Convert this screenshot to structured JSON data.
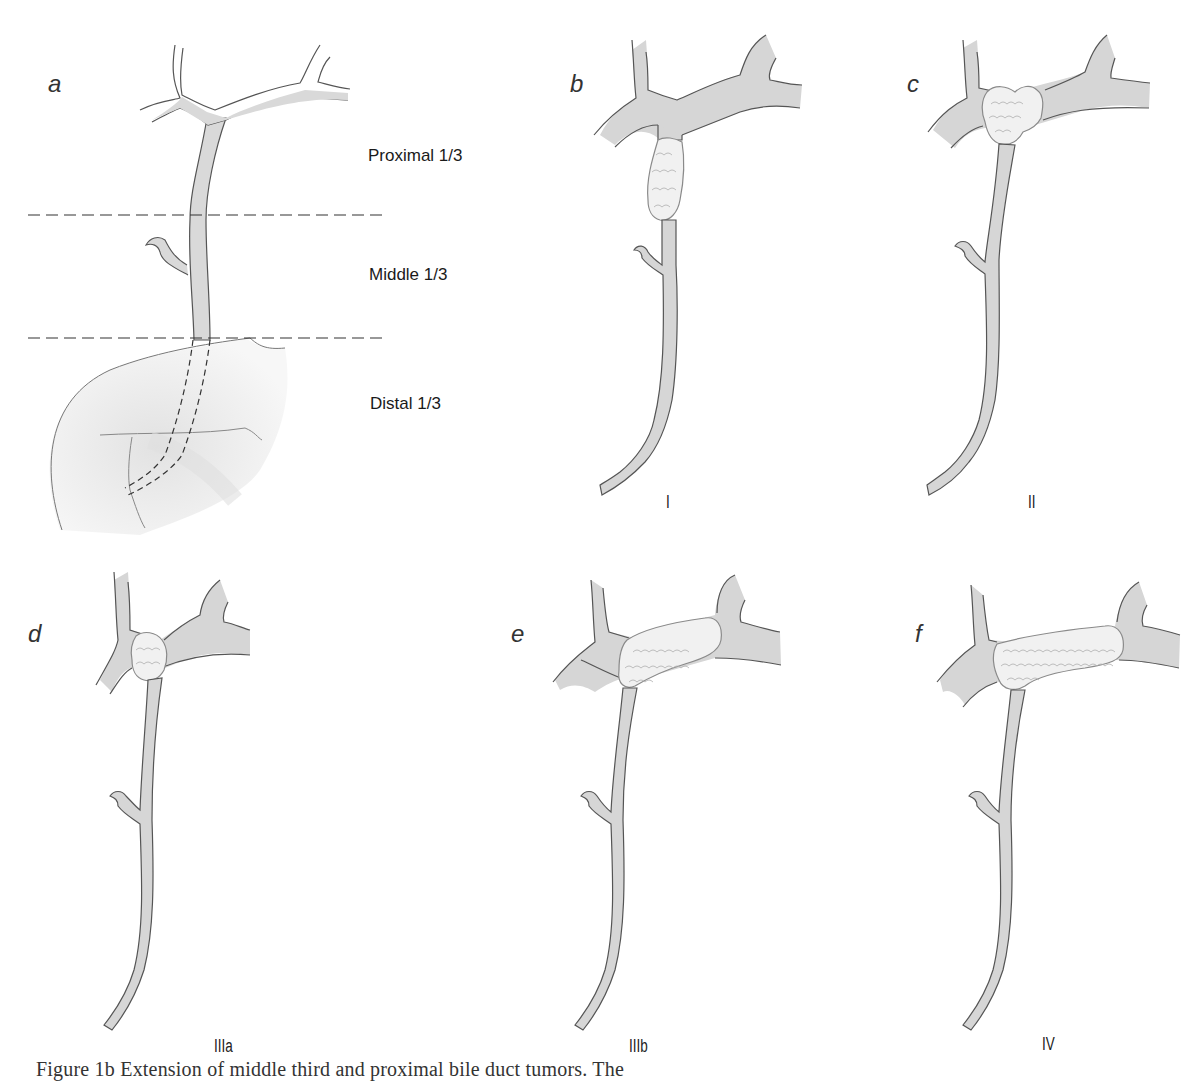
{
  "figure": {
    "panels": [
      {
        "id": "a",
        "letter": "a",
        "type_label": "",
        "description": "Bile duct divided into thirds",
        "regions": [
          "Proximal 1/3",
          "Middle 1/3",
          "Distal 1/3"
        ]
      },
      {
        "id": "b",
        "letter": "b",
        "type_label": "I",
        "description": "Tumor below hilar confluence"
      },
      {
        "id": "c",
        "letter": "c",
        "type_label": "II",
        "description": "Tumor at hilar confluence"
      },
      {
        "id": "d",
        "letter": "d",
        "type_label": "IIIa",
        "description": "Tumor extending into right hepatic duct"
      },
      {
        "id": "e",
        "letter": "e",
        "type_label": "IIIb",
        "description": "Tumor extending into left hepatic duct"
      },
      {
        "id": "f",
        "letter": "f",
        "type_label": "IV",
        "description": "Tumor involving both hepatic ducts"
      }
    ],
    "caption": "Figure 1b  Extension of middle third and proximal bile duct tumors.  The                    ",
    "colors": {
      "duct_fill": "#d9d9d9",
      "duct_stroke": "#555555",
      "tumor_fill": "#f2f2f2",
      "tumor_stroke": "#8a8a8a",
      "dash_line": "#333333",
      "pancreas_fill": "#ececec"
    }
  }
}
